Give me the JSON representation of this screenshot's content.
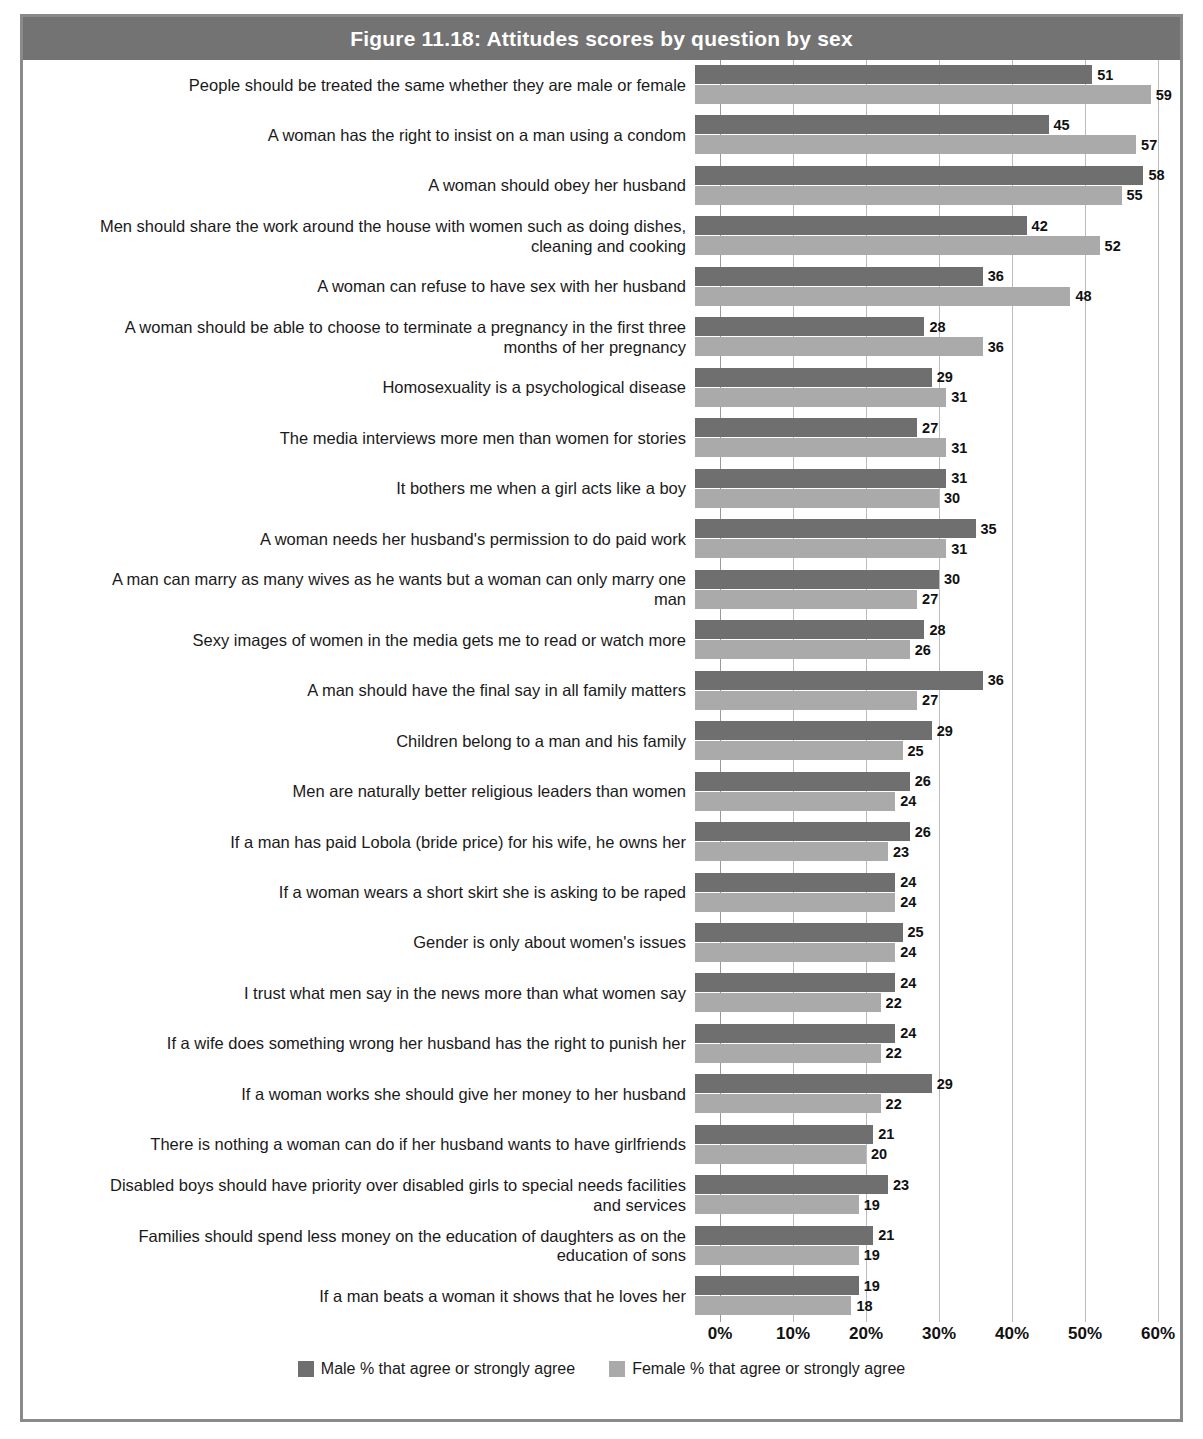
{
  "figure": {
    "title": "Figure 11.18: Attitudes scores by question by sex"
  },
  "colors": {
    "title_bar": "#737373",
    "male_bar": "#6f6f6f",
    "female_bar": "#aaaaaa",
    "gridline": "#bcbcbc",
    "frame": "#8a8a8a"
  },
  "legend": {
    "position": "bottom",
    "items": [
      {
        "label": "Male % that agree or strongly agree",
        "color": "#6f6f6f"
      },
      {
        "label": "Female % that agree or strongly agree",
        "color": "#aaaaaa"
      }
    ]
  },
  "axis": {
    "ticks": [
      "0%",
      "10%",
      "20%",
      "30%",
      "40%",
      "50%",
      "60%"
    ],
    "min": 0,
    "max": 60
  },
  "chart_data": {
    "type": "bar",
    "orientation": "horizontal",
    "title": "Figure 11.18: Attitudes scores by question by sex",
    "xlabel": "",
    "ylabel": "",
    "xlim": [
      0,
      60
    ],
    "xticks": [
      0,
      10,
      20,
      30,
      40,
      50,
      60
    ],
    "xtick_labels": [
      "0%",
      "10%",
      "20%",
      "30%",
      "40%",
      "50%",
      "60%"
    ],
    "grid": true,
    "legend_position": "bottom",
    "categories": [
      "People should be treated the same whether they are male or female",
      "A woman has the right to insist on a man using a condom",
      "A woman should obey her husband",
      "Men should share the work around the house with women such as doing dishes, cleaning and cooking",
      "A woman can refuse to have sex with her husband",
      "A woman should be able to choose to terminate a pregnancy in the first three months of her pregnancy",
      "Homosexuality is a psychological disease",
      "The media interviews more men than women for stories",
      "It bothers me when a girl acts like a boy",
      "A woman needs her husband's permission to do paid work",
      "A man can marry as many wives as he wants but a woman can only marry one man",
      "Sexy images of women in the media gets me to read or watch more",
      "A man should have the final say in all family matters",
      "Children belong to a man and his family",
      "Men are naturally better religious leaders than women",
      "If a man has paid Lobola (bride price) for his wife, he owns her",
      "If a woman wears a short skirt she is asking to be raped",
      "Gender is only about women's issues",
      "I trust what men say in the news more than what women say",
      "If a wife does something wrong her husband has the right to punish her",
      "If a woman works she should give her money to her husband",
      "There is nothing a woman can do if her husband wants to have girlfriends",
      "Disabled boys should have priority over disabled girls to special needs facilities and services",
      "Families should spend less money on the education of daughters as on the education of sons",
      "If a man beats a woman it shows that he loves her"
    ],
    "series": [
      {
        "name": "Male % that agree or strongly agree",
        "color": "#6f6f6f",
        "values": [
          51,
          45,
          58,
          42,
          36,
          28,
          29,
          27,
          31,
          35,
          30,
          28,
          36,
          29,
          26,
          26,
          24,
          25,
          24,
          24,
          29,
          21,
          23,
          21,
          19
        ]
      },
      {
        "name": "Female % that agree or strongly agree",
        "color": "#aaaaaa",
        "values": [
          59,
          57,
          55,
          52,
          48,
          36,
          31,
          31,
          30,
          31,
          27,
          26,
          27,
          25,
          24,
          23,
          24,
          24,
          22,
          22,
          22,
          20,
          19,
          19,
          18
        ]
      }
    ]
  },
  "rows": [
    {
      "label_lines": [
        "People should be treated the same whether they are male or female"
      ],
      "male": 51,
      "female": 59
    },
    {
      "label_lines": [
        "A woman has the right to insist on a man using a condom"
      ],
      "male": 45,
      "female": 57
    },
    {
      "label_lines": [
        "A woman should obey her husband"
      ],
      "male": 58,
      "female": 55
    },
    {
      "label_lines": [
        "Men should share the work around the house with women such as doing dishes,",
        "cleaning and cooking"
      ],
      "male": 42,
      "female": 52
    },
    {
      "label_lines": [
        "A woman can refuse to have sex with her husband"
      ],
      "male": 36,
      "female": 48
    },
    {
      "label_lines": [
        "A woman should be able to choose to terminate a pregnancy in the first three",
        "months of her pregnancy"
      ],
      "male": 28,
      "female": 36
    },
    {
      "label_lines": [
        "Homosexuality is a psychological disease"
      ],
      "male": 29,
      "female": 31
    },
    {
      "label_lines": [
        "The media interviews more men than women for stories"
      ],
      "male": 27,
      "female": 31
    },
    {
      "label_lines": [
        "It bothers me when a girl acts like a boy"
      ],
      "male": 31,
      "female": 30
    },
    {
      "label_lines": [
        "A woman needs her husband's permission to do paid work"
      ],
      "male": 35,
      "female": 31
    },
    {
      "label_lines": [
        "A man can marry as many wives as he wants but a woman can only marry one",
        "man"
      ],
      "male": 30,
      "female": 27
    },
    {
      "label_lines": [
        "Sexy images of women in the media gets me to read or watch more"
      ],
      "male": 28,
      "female": 26
    },
    {
      "label_lines": [
        "A man should have the final say in all family matters"
      ],
      "male": 36,
      "female": 27
    },
    {
      "label_lines": [
        "Children belong to a man and his family"
      ],
      "male": 29,
      "female": 25
    },
    {
      "label_lines": [
        "Men are naturally better religious leaders than women"
      ],
      "male": 26,
      "female": 24
    },
    {
      "label_lines": [
        "If a man has paid Lobola (bride price) for his wife, he owns her"
      ],
      "male": 26,
      "female": 23
    },
    {
      "label_lines": [
        "If a woman wears a short skirt she is asking to be raped"
      ],
      "male": 24,
      "female": 24
    },
    {
      "label_lines": [
        "Gender is only about women's issues"
      ],
      "male": 25,
      "female": 24
    },
    {
      "label_lines": [
        "I trust what men say in the news more than what women say"
      ],
      "male": 24,
      "female": 22
    },
    {
      "label_lines": [
        "If a wife does something wrong her husband has the right to punish her"
      ],
      "male": 24,
      "female": 22
    },
    {
      "label_lines": [
        "If a woman works she should give her money to her husband"
      ],
      "male": 29,
      "female": 22
    },
    {
      "label_lines": [
        "There is nothing a woman can do if her husband wants to have girlfriends"
      ],
      "male": 21,
      "female": 20
    },
    {
      "label_lines": [
        "Disabled boys should have priority over disabled girls to special needs facilities",
        "and services"
      ],
      "male": 23,
      "female": 19
    },
    {
      "label_lines": [
        "Families should spend less money on the education of daughters as on the",
        "education of sons"
      ],
      "male": 21,
      "female": 19
    },
    {
      "label_lines": [
        "If a man beats a woman it shows that he loves her"
      ],
      "male": 19,
      "female": 18
    }
  ]
}
